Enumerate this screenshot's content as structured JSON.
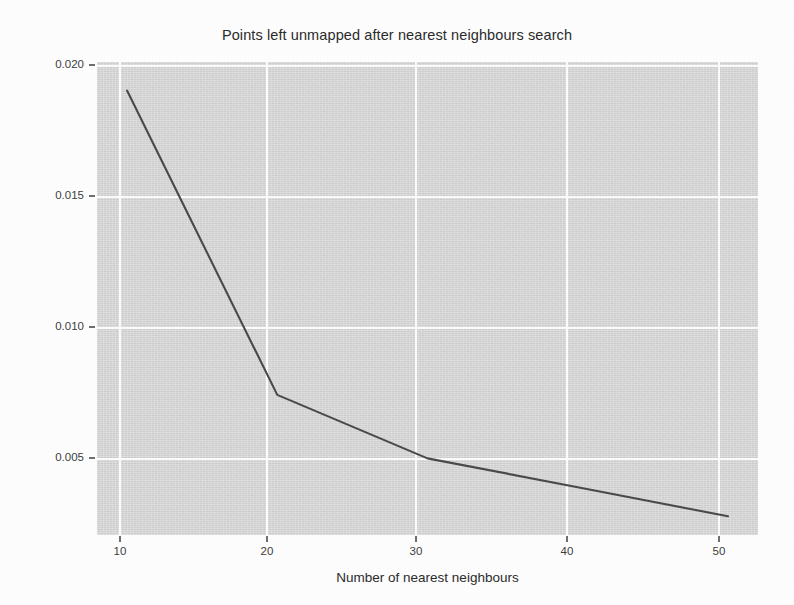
{
  "figure": {
    "title": "Points left unmapped after nearest neighbours search",
    "line_color": "#4a4a4a",
    "panel_color": "#d8d8d8",
    "grid_color": "#fbfbfb"
  },
  "axes": {
    "x_title": "Number of nearest neighbours",
    "y_title": "Proportion of points left unmapped",
    "x_ticks": [
      "10",
      "20",
      "30",
      "40",
      "50"
    ],
    "y_ticks": [
      "0.005",
      "0.010",
      "0.015",
      "0.020"
    ]
  },
  "scan_artifacts": {
    "note": "faint bleed-through ghost text from reverse of scanned page",
    "lines": [
      "a and the m to the m of the ex",
      "was the search a more than a on the",
      "a set of the of the data the"
    ]
  },
  "chart_data": {
    "type": "line",
    "title": "Points left unmapped after nearest neighbours search",
    "xlabel": "Number of nearest neighbours",
    "ylabel": "Proportion of points left unmapped",
    "x": [
      10,
      20,
      30,
      40,
      50
    ],
    "values": [
      0.01947,
      0.00744,
      0.00493,
      0.00379,
      0.00264
    ],
    "series": [
      {
        "name": "Proportion of points left unmapped",
        "values": [
          0.01947,
          0.00744,
          0.00493,
          0.00379,
          0.00264
        ]
      }
    ],
    "xlim": [
      8,
      52
    ],
    "ylim": [
      0.0019,
      0.0206
    ],
    "x_ticks": [
      10,
      20,
      30,
      40,
      50
    ],
    "y_ticks": [
      0.005,
      0.01,
      0.015,
      0.02
    ],
    "grid": true,
    "legend": "none",
    "markers": false
  }
}
